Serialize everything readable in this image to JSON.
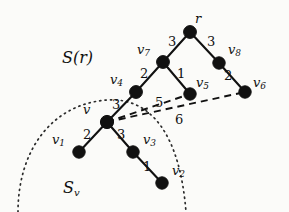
{
  "figure": {
    "background_color": "#fbfbf9",
    "ink_color": "#111111",
    "width": 289,
    "height": 212
  },
  "regions": [
    {
      "id": "region-sr",
      "label": "S(r)",
      "x": 62,
      "y": 50
    }
  ],
  "region_sv": {
    "symbol": "S",
    "subscript": "v",
    "x": 63,
    "y": 180
  },
  "nodes": [
    {
      "id": "r",
      "label": "r",
      "sub": "",
      "x": 190,
      "y": 32,
      "lx": 195,
      "ly": 12
    },
    {
      "id": "v7",
      "label": "v",
      "sub": "7",
      "x": 163,
      "y": 62,
      "lx": 137,
      "ly": 43
    },
    {
      "id": "v8",
      "label": "v",
      "sub": "8",
      "x": 219,
      "y": 63,
      "lx": 228,
      "ly": 43
    },
    {
      "id": "v4",
      "label": "v",
      "sub": "4",
      "x": 136,
      "y": 92,
      "lx": 110,
      "ly": 73
    },
    {
      "id": "v5",
      "label": "v",
      "sub": "5",
      "x": 190,
      "y": 94,
      "lx": 196,
      "ly": 76
    },
    {
      "id": "v6",
      "label": "v",
      "sub": "6",
      "x": 245,
      "y": 92,
      "lx": 253,
      "ly": 76
    },
    {
      "id": "v",
      "label": "v",
      "sub": "",
      "x": 107,
      "y": 122,
      "lx": 83,
      "ly": 103
    },
    {
      "id": "v1",
      "label": "v",
      "sub": "1",
      "x": 79,
      "y": 152,
      "lx": 52,
      "ly": 133
    },
    {
      "id": "v3",
      "label": "v",
      "sub": "3",
      "x": 133,
      "y": 152,
      "lx": 143,
      "ly": 133
    },
    {
      "id": "v2",
      "label": "v",
      "sub": "2",
      "x": 162,
      "y": 183,
      "lx": 172,
      "ly": 164
    }
  ],
  "tree_edges": [
    {
      "id": "edge-v7-r",
      "from": "v7",
      "to": "r",
      "weight": "3",
      "wx": 168,
      "wy": 35
    },
    {
      "id": "edge-r-v8",
      "from": "r",
      "to": "v8",
      "weight": "3",
      "wx": 207,
      "wy": 35
    },
    {
      "id": "edge-v4-v7",
      "from": "v4",
      "to": "v7",
      "weight": "2",
      "wx": 140,
      "wy": 67
    },
    {
      "id": "edge-v7-v5",
      "from": "v7",
      "to": "v5",
      "weight": "1",
      "wx": 177,
      "wy": 67
    },
    {
      "id": "edge-v8-v6",
      "from": "v8",
      "to": "v6",
      "weight": "2",
      "wx": 224,
      "wy": 69
    },
    {
      "id": "edge-v-v4",
      "from": "v",
      "to": "v4",
      "weight": "3",
      "wx": 112,
      "wy": 98
    },
    {
      "id": "edge-v1-v",
      "from": "v1",
      "to": "v",
      "weight": "2",
      "wx": 83,
      "wy": 128
    },
    {
      "id": "edge-v-v3",
      "from": "v",
      "to": "v3",
      "weight": "3",
      "wx": 117,
      "wy": 128
    },
    {
      "id": "edge-v3-v2",
      "from": "v3",
      "to": "v2",
      "weight": "1",
      "wx": 143,
      "wy": 160
    }
  ],
  "cut_edges": [
    {
      "id": "edge-v-v5",
      "from": "v",
      "to": "v5",
      "weight": "5",
      "wx": 155,
      "wy": 96
    },
    {
      "id": "edge-v-v6",
      "from": "v",
      "to": "v6",
      "weight": "6",
      "wx": 175,
      "wy": 113
    }
  ],
  "node_radius": 6.2
}
